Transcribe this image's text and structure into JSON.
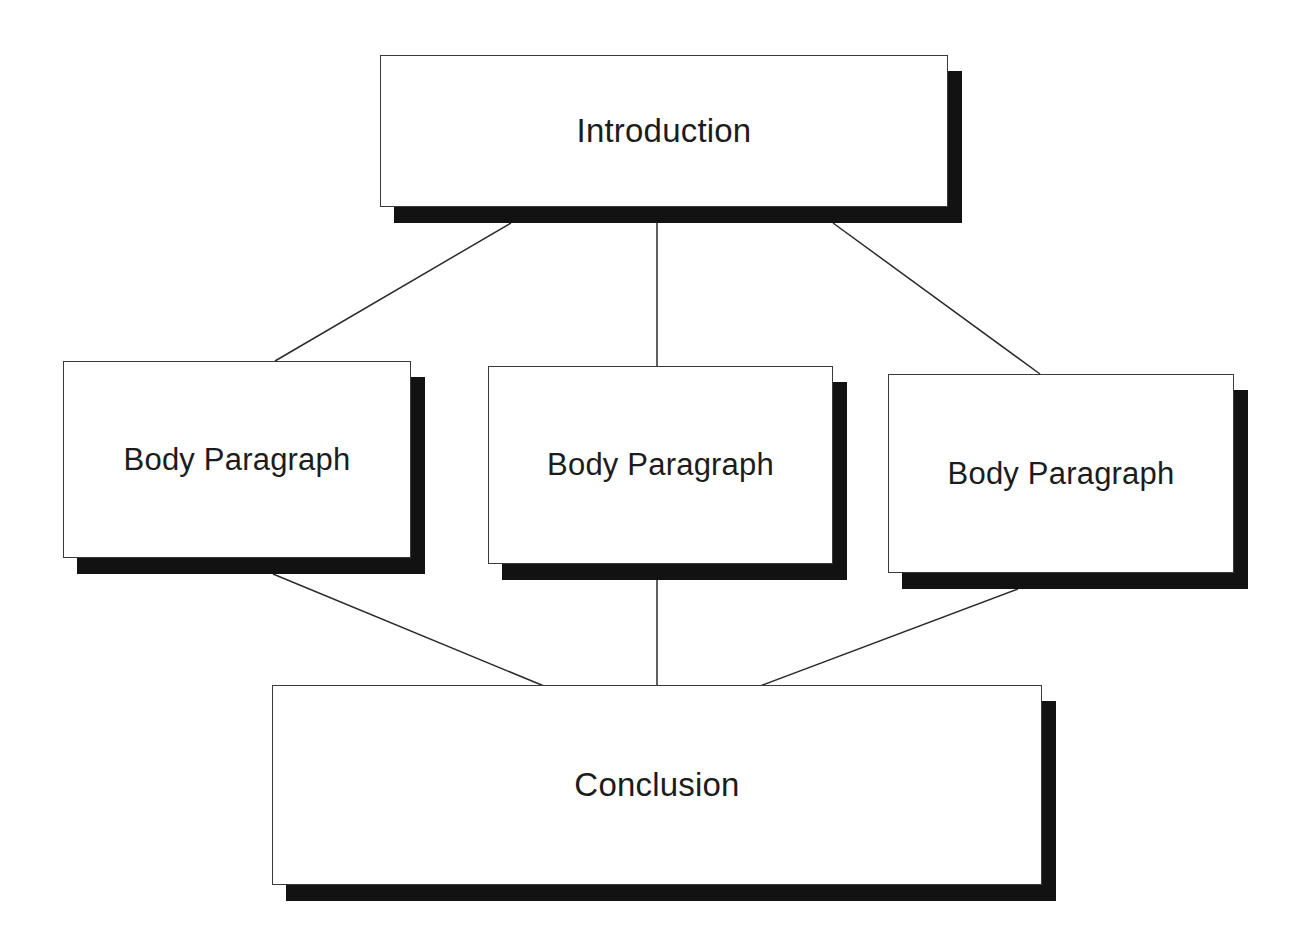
{
  "diagram": {
    "type": "flowchart",
    "background_color": "#ffffff",
    "box_fill_color": "#ffffff",
    "box_border_color": "#3a3a3a",
    "shadow_color": "#121212",
    "text_color": "#1c1c1c",
    "connector_color": "#2b2b2b",
    "nodes": [
      {
        "id": "introduction",
        "label": "Introduction",
        "level": "top",
        "x": 380,
        "y": 55,
        "w": 568,
        "h": 152,
        "shadow_dx": 14,
        "shadow_dy": 16,
        "size": "big"
      },
      {
        "id": "body-paragraph-1",
        "label": "Body Paragraph",
        "level": "middle",
        "x": 63,
        "y": 361,
        "w": 348,
        "h": 197,
        "shadow_dx": 14,
        "shadow_dy": 16,
        "size": "mid"
      },
      {
        "id": "body-paragraph-2",
        "label": "Body Paragraph",
        "level": "middle",
        "x": 488,
        "y": 366,
        "w": 345,
        "h": 198,
        "shadow_dx": 14,
        "shadow_dy": 16,
        "size": "mid"
      },
      {
        "id": "body-paragraph-3",
        "label": "Body Paragraph",
        "level": "middle",
        "x": 888,
        "y": 374,
        "w": 346,
        "h": 199,
        "shadow_dx": 14,
        "shadow_dy": 16,
        "size": "mid"
      },
      {
        "id": "conclusion",
        "label": "Conclusion",
        "level": "bottom",
        "x": 272,
        "y": 685,
        "w": 770,
        "h": 200,
        "shadow_dx": 14,
        "shadow_dy": 16,
        "size": "big"
      }
    ],
    "connectors": [
      {
        "id": "intro-to-body1",
        "from": "introduction",
        "to": "body-paragraph-1",
        "x1": 511,
        "y1": 223,
        "x2": 275,
        "y2": 361
      },
      {
        "id": "intro-to-body2",
        "from": "introduction",
        "to": "body-paragraph-2",
        "x1": 657,
        "y1": 223,
        "x2": 657,
        "y2": 366
      },
      {
        "id": "intro-to-body3",
        "from": "introduction",
        "to": "body-paragraph-3",
        "x1": 833,
        "y1": 223,
        "x2": 1040,
        "y2": 374
      },
      {
        "id": "body1-to-conclusion",
        "from": "body-paragraph-1",
        "to": "conclusion",
        "x1": 273,
        "y1": 574,
        "x2": 544,
        "y2": 686
      },
      {
        "id": "body2-to-conclusion",
        "from": "body-paragraph-2",
        "to": "conclusion",
        "x1": 657,
        "y1": 580,
        "x2": 657,
        "y2": 686
      },
      {
        "id": "body3-to-conclusion",
        "from": "body-paragraph-3",
        "to": "conclusion",
        "x1": 1018,
        "y1": 589,
        "x2": 760,
        "y2": 686
      }
    ]
  }
}
